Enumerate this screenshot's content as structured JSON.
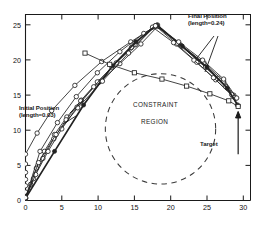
{
  "chart_data": {
    "type": "line",
    "title": "",
    "xlabel": "",
    "ylabel": "",
    "xlim": [
      0,
      31
    ],
    "ylim": [
      0,
      26.5
    ],
    "xticks": [
      0,
      5,
      10,
      15,
      20,
      25,
      30
    ],
    "yticks": [
      0,
      5,
      10,
      15,
      20,
      25
    ],
    "grid": false,
    "legend_position": "none",
    "annotations": [
      {
        "name": "initial-position",
        "text_line1": "Initial Position",
        "text_line2": "(length=0.03)",
        "x": 1.2,
        "y": 11.5
      },
      {
        "name": "final-position",
        "text_line1": "Final Position",
        "text_line2": "(length=0.24)",
        "x": 23.5,
        "y": 25.3
      },
      {
        "name": "constraint-region-line1",
        "text": "CONSTRAINT",
        "x": 16.5,
        "y": 11.5
      },
      {
        "name": "constraint-region-line2",
        "text": "REGION",
        "x": 17.5,
        "y": 9.2
      },
      {
        "name": "target-label",
        "text": "Target",
        "x": 25.5,
        "y": 5.9
      }
    ],
    "constraint_circle": {
      "cx": 18.6,
      "cy": 10.2,
      "r": 7.6,
      "style": "dashed"
    },
    "series": [
      {
        "name": "trajectory-1-initial",
        "marker": "circle-open",
        "x": [
          0,
          0,
          0,
          0,
          0,
          0,
          0,
          1.6,
          3.6,
          6.8,
          10.5,
          14.5,
          18.0,
          21.3,
          24.6,
          27.3,
          29.0
        ],
        "y": [
          0.4,
          1.2,
          2.1,
          3.0,
          4.0,
          5.2,
          6.6,
          9.6,
          12.8,
          16.4,
          19.8,
          22.6,
          24.9,
          22.2,
          19.6,
          17.0,
          14.6
        ]
      },
      {
        "name": "trajectory-2",
        "marker": "circle-open",
        "x": [
          0,
          0.7,
          1.5,
          2.6,
          4.0,
          5.7,
          7.7,
          10.2,
          13.0,
          15.9,
          18.2,
          21.0,
          23.9,
          26.5,
          28.7
        ],
        "y": [
          0.3,
          2.3,
          4.6,
          7.0,
          9.4,
          11.9,
          14.3,
          16.9,
          19.5,
          22.3,
          24.8,
          22.4,
          19.8,
          17.4,
          15.0
        ]
      },
      {
        "name": "trajectory-3",
        "marker": "circle-open",
        "x": [
          0,
          1.1,
          2.4,
          3.9,
          5.6,
          7.6,
          9.9,
          12.5,
          15.2,
          17.9,
          20.8,
          23.6,
          26.2,
          28.6
        ],
        "y": [
          0.3,
          3.1,
          6.0,
          8.8,
          11.5,
          14.2,
          16.9,
          19.6,
          22.2,
          24.9,
          22.3,
          19.7,
          17.2,
          14.8
        ]
      },
      {
        "name": "trajectory-4",
        "marker": "circle-open",
        "x": [
          0,
          1.4,
          3.1,
          5.0,
          7.1,
          9.4,
          11.9,
          14.6,
          17.5,
          20.4,
          23.2,
          25.9,
          28.4
        ],
        "y": [
          0.3,
          3.7,
          7.0,
          10.2,
          13.3,
          16.2,
          19.0,
          21.8,
          24.7,
          22.5,
          20.0,
          17.5,
          15.1
        ]
      },
      {
        "name": "trajectory-5-outer",
        "marker": "circle-open",
        "x": [
          0,
          2.0,
          4.4,
          7.0,
          9.9,
          13.0,
          16.3,
          18.2,
          21.5,
          24.8,
          27.6,
          29.2
        ],
        "y": [
          0.4,
          7.0,
          11.1,
          14.8,
          18.2,
          21.2,
          23.8,
          25.0,
          22.0,
          19.0,
          16.2,
          13.6
        ]
      },
      {
        "name": "trajectory-6-final",
        "marker": "filled",
        "x": [
          0,
          4.0,
          8.0,
          12.0,
          15.2,
          18.1,
          21.6,
          25.0,
          27.8,
          29.3
        ],
        "y": [
          0.3,
          7.0,
          13.6,
          19.2,
          22.6,
          25.0,
          22.0,
          19.0,
          16.0,
          13.5
        ]
      },
      {
        "name": "trajectory-upper-branch",
        "marker": "circle-open",
        "x": [
          0,
          1.8,
          4.2,
          7.2,
          10.6,
          14.2,
          17.9,
          21.1,
          24.4,
          27.3,
          29.1
        ],
        "y": [
          0.4,
          5.4,
          9.4,
          13.2,
          17.0,
          21.0,
          24.9,
          22.6,
          20.0,
          17.3,
          14.6
        ]
      },
      {
        "name": "lower-branch-descending",
        "marker": "square-open",
        "x": [
          8.2,
          11.6,
          15.0,
          18.8,
          22.2,
          25.4,
          28.0,
          29.3
        ],
        "y": [
          21.0,
          19.4,
          18.2,
          17.3,
          16.3,
          15.2,
          14.2,
          13.4
        ]
      }
    ],
    "target_marker": {
      "x": 29.3,
      "y": 13.4,
      "arrow_from_y": 6.6
    }
  },
  "labels": {
    "initial_position": {
      "line1": "Initial Position",
      "line2": "(length=0.03)"
    },
    "final_position": {
      "line1": "Final Position",
      "line2": "(length=0.24)"
    },
    "constraint": {
      "line1": "CONSTRAINT",
      "line2": "REGION"
    },
    "target": "Target"
  },
  "colors": {
    "axis": "#1a1a1a",
    "curve": "#222222",
    "constraint_circle": "#3a3a3a",
    "background": "#ffffff"
  }
}
